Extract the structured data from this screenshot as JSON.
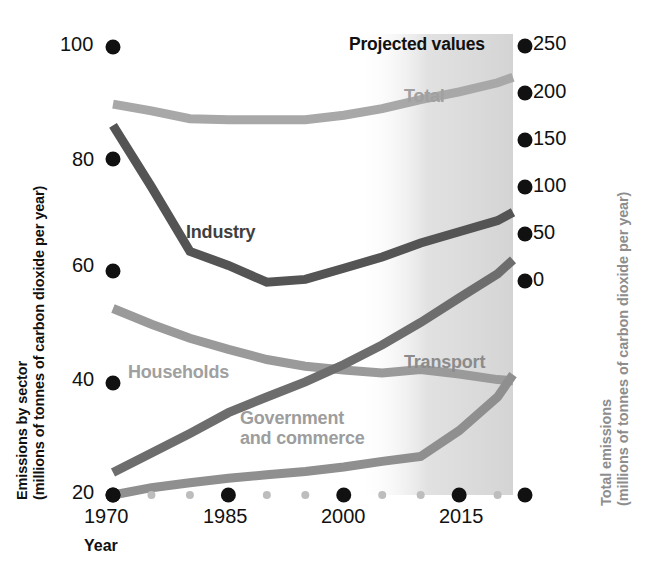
{
  "chart_data": {
    "type": "line",
    "title": "",
    "xlabel": "Year",
    "ylabel_left_line1": "Emissions by sector",
    "ylabel_left_line2": "(millions of tonnes of carbon dioxide per year)",
    "ylabel_right_line1": "Total emissions",
    "ylabel_right_line2": "(millions of tonnes of carbon dioxide per year)",
    "x": [
      1970,
      1975,
      1980,
      1985,
      1990,
      1995,
      2000,
      2005,
      2010,
      2015,
      2020,
      2022
    ],
    "xlim": [
      1970,
      2022
    ],
    "xticks_major": [
      "1970",
      "1985",
      "2000",
      "2015"
    ],
    "xticks_major_values": [
      1970,
      1985,
      2000,
      2015
    ],
    "xticks_minor_values": [
      1975,
      1980,
      1990,
      1995,
      2005,
      2010,
      2020
    ],
    "left_axis": {
      "ylim": [
        20,
        100
      ],
      "ticks": [
        "20",
        "40",
        "60",
        "80",
        "100"
      ],
      "tick_values": [
        20,
        40,
        60,
        80,
        100
      ]
    },
    "right_axis": {
      "ylim": [
        0,
        250
      ],
      "ticks": [
        "0",
        "50",
        "100",
        "150",
        "200",
        "250"
      ],
      "tick_values": [
        0,
        50,
        100,
        150,
        200,
        250
      ]
    },
    "grid": false,
    "legend": "inline-labels",
    "annotations": [
      {
        "name": "projected-values",
        "text": "Projected values",
        "x_start": 2003,
        "x_end": 2022
      }
    ],
    "series": [
      {
        "name": "Total",
        "label": "Total",
        "axis": "right",
        "color": "#a8a8a8",
        "values_right_axis": [
          200,
          196,
          190,
          189,
          189,
          189,
          192,
          197,
          205,
          213,
          222,
          228
        ],
        "points_left_scale": [
          89.8,
          88.6,
          87.2,
          87.0,
          87.0,
          87.0,
          87.8,
          89.0,
          90.6,
          92.0,
          93.6,
          94.6
        ]
      },
      {
        "name": "Industry",
        "label": "Industry",
        "axis": "left",
        "color": "#545454",
        "values": [
          86.0,
          75.0,
          63.5,
          61.0,
          58.0,
          58.5,
          60.5,
          62.5,
          65.0,
          67.0,
          69.0,
          70.5
        ]
      },
      {
        "name": "Households",
        "label": "Households",
        "axis": "left",
        "color": "#9a9a9a",
        "values": [
          53.3,
          50.5,
          48.0,
          46.0,
          44.2,
          43.0,
          42.3,
          41.8,
          42.4,
          41.6,
          40.6,
          40.4
        ]
      },
      {
        "name": "Transport",
        "label": "Transport",
        "axis": "left",
        "color": "#6d6d6d",
        "values": [
          24.0,
          27.5,
          31.0,
          34.7,
          37.5,
          40.2,
          43.3,
          46.8,
          50.8,
          55.2,
          59.5,
          62.0
        ]
      },
      {
        "name": "Government and commerce",
        "label": "Government\nand commerce",
        "label_line1": "Government",
        "label_line2": "and commerce",
        "axis": "left",
        "color": "#8f8f8f",
        "values": [
          20.0,
          21.3,
          22.2,
          23.0,
          23.6,
          24.2,
          25.0,
          26.0,
          26.9,
          31.5,
          37.5,
          41.5
        ]
      }
    ]
  },
  "axis_titles": {
    "x": "Year",
    "left_line1": "Emissions by sector",
    "left_line2": "(millions of tonnes of carbon dioxide per year)",
    "right_line1": "Total emissions",
    "right_line2": "(millions of tonnes of carbon dioxide per year)"
  },
  "series_labels": {
    "total": "Total",
    "industry": "Industry",
    "households": "Households",
    "transport": "Transport",
    "government_line1": "Government",
    "government_line2": "and commerce"
  },
  "annotation": {
    "projected": "Projected values"
  },
  "colors": {
    "total": "#a8a8a8",
    "industry": "#545454",
    "households": "#9a9a9a",
    "transport": "#6d6d6d",
    "government": "#8f8f8f",
    "tick_dot": "#111111",
    "minor_tick_dot": "#bdbdbd",
    "right_axis_title": "#8d8d8d",
    "projection_shade": "#d8d8d8",
    "background": "#ffffff"
  },
  "ticks": {
    "left": [
      "100",
      "80",
      "60",
      "40",
      "20"
    ],
    "right": [
      "250",
      "200",
      "150",
      "100",
      "50",
      "0"
    ],
    "x": [
      "1970",
      "1985",
      "2000",
      "2015"
    ]
  }
}
